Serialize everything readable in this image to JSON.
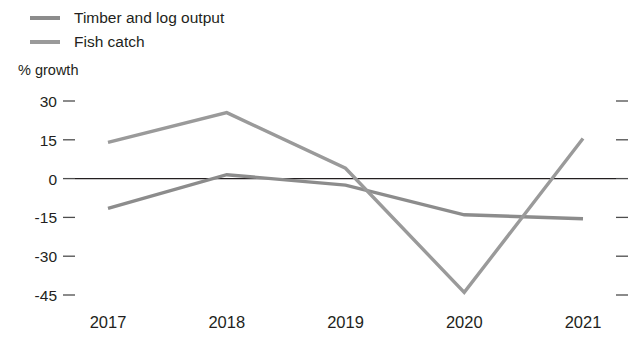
{
  "chart_data": {
    "type": "line",
    "title": "",
    "subtitle": "",
    "xlabel": "",
    "ylabel": "% growth",
    "categories": [
      "2017",
      "2018",
      "2019",
      "2020",
      "2021"
    ],
    "x": [
      2017,
      2018,
      2019,
      2020,
      2021
    ],
    "series": [
      {
        "name": "Timber and log output",
        "color": "#8c8c8c",
        "values": [
          -11.5,
          1.5,
          -2.5,
          -14.0,
          -15.5
        ]
      },
      {
        "name": "Fish catch",
        "color": "#9a9a9a",
        "values": [
          14.0,
          25.5,
          4.0,
          -44.0,
          15.5
        ]
      }
    ],
    "ylim": [
      -45,
      30
    ],
    "y_ticks": [
      30,
      15,
      0,
      -15,
      -30,
      -45
    ],
    "y_tick_labels": [
      "30",
      "15",
      "0",
      "-15",
      "-30",
      "-45"
    ],
    "grid": false,
    "zero_line": true,
    "right_ticks": true,
    "legend_position": "top-left"
  },
  "legend": {
    "items": [
      {
        "label": "Timber and log output",
        "color": "#8c8c8c"
      },
      {
        "label": "Fish catch",
        "color": "#9a9a9a"
      }
    ]
  },
  "axis": {
    "y_title": "% growth"
  }
}
